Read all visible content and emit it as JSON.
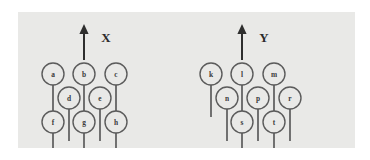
{
  "figure": {
    "background_color": "#ffffff",
    "panel_color": "#e9e9e7",
    "ink_color": "#5b5b5b",
    "axis_color": "#2e2e2e",
    "diagrams": [
      {
        "name": "left-diagram",
        "axis_label": "X",
        "axis": {
          "x": 66,
          "tip_y": 12,
          "base_y": 48
        },
        "nodes": [
          {
            "id": "a",
            "label": "a",
            "cx": 35,
            "cy": 62,
            "r": 11,
            "stem_length": 32
          },
          {
            "id": "b",
            "label": "b",
            "cx": 66,
            "cy": 62,
            "r": 11,
            "stem_length": 32
          },
          {
            "id": "c",
            "label": "c",
            "cx": 98,
            "cy": 62,
            "r": 11,
            "stem_length": 32
          },
          {
            "id": "d",
            "label": "d",
            "cx": 51,
            "cy": 86,
            "r": 11,
            "stem_length": 32
          },
          {
            "id": "e",
            "label": "e",
            "cx": 82,
            "cy": 86,
            "r": 11,
            "stem_length": 32
          },
          {
            "id": "f",
            "label": "f",
            "cx": 35,
            "cy": 110,
            "r": 11,
            "stem_length": 32
          },
          {
            "id": "g",
            "label": "g",
            "cx": 66,
            "cy": 110,
            "r": 11,
            "stem_length": 32
          },
          {
            "id": "h",
            "label": "h",
            "cx": 98,
            "cy": 110,
            "r": 11,
            "stem_length": 32
          }
        ]
      },
      {
        "name": "right-diagram",
        "axis_label": "Y",
        "axis": {
          "x": 224,
          "tip_y": 12,
          "base_y": 48
        },
        "nodes": [
          {
            "id": "k",
            "label": "k",
            "cx": 193,
            "cy": 62,
            "r": 11,
            "stem_length": 32
          },
          {
            "id": "l",
            "label": "l",
            "cx": 224,
            "cy": 62,
            "r": 11,
            "stem_length": 32
          },
          {
            "id": "m",
            "label": "m",
            "cx": 256,
            "cy": 62,
            "r": 11,
            "stem_length": 32
          },
          {
            "id": "n",
            "label": "n",
            "cx": 209,
            "cy": 86,
            "r": 11,
            "stem_length": 32
          },
          {
            "id": "p",
            "label": "p",
            "cx": 240,
            "cy": 86,
            "r": 11,
            "stem_length": 32
          },
          {
            "id": "r",
            "label": "r",
            "cx": 272,
            "cy": 86,
            "r": 11,
            "stem_length": 32
          },
          {
            "id": "s",
            "label": "s",
            "cx": 224,
            "cy": 110,
            "r": 11,
            "stem_length": 32
          },
          {
            "id": "t",
            "label": "t",
            "cx": 256,
            "cy": 110,
            "r": 11,
            "stem_length": 32
          }
        ]
      }
    ]
  }
}
